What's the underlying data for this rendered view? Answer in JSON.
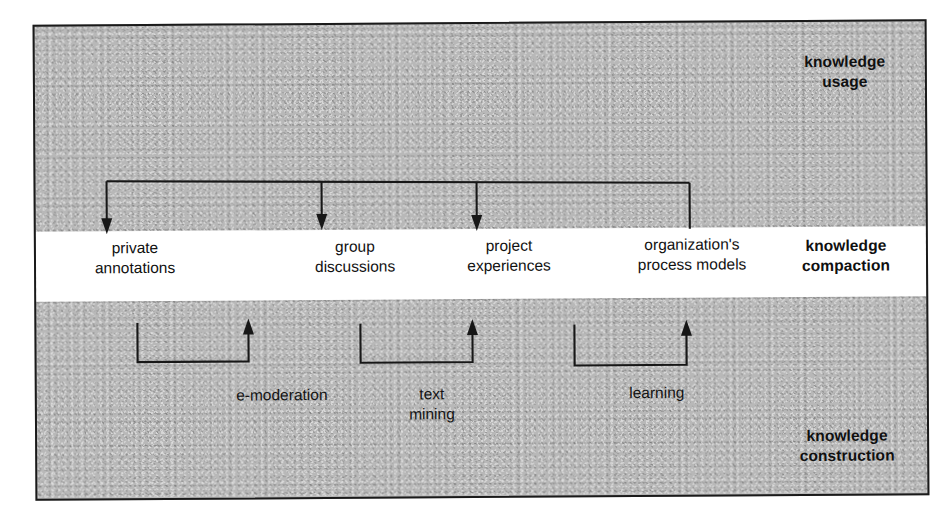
{
  "diagram": {
    "background_color": "#b9b9b9",
    "band_color": "#ffffff",
    "line_color": "#171717",
    "zones": [
      {
        "id": "usage",
        "label": "knowledge\nusage",
        "position": "top-right"
      },
      {
        "id": "compaction",
        "label": "knowledge\ncompaction",
        "position": "middle-right"
      },
      {
        "id": "construction",
        "label": "knowledge\nconstruction",
        "position": "bottom-right"
      }
    ],
    "nodes": [
      {
        "id": "private-annotations",
        "label": "private\nannotations"
      },
      {
        "id": "group-discussions",
        "label": "group\ndiscussions"
      },
      {
        "id": "project-experiences",
        "label": "project\nexperiences"
      },
      {
        "id": "organizations-process-models",
        "label": "organization's\nprocess models"
      }
    ],
    "processes": [
      {
        "id": "e-moderation",
        "label": "e-moderation"
      },
      {
        "id": "text-mining",
        "label": "text\nmining"
      },
      {
        "id": "learning",
        "label": "learning"
      }
    ],
    "connectors": {
      "usage_bus": {
        "description": "horizontal bus in the upper zone feeding arrows down into the compaction band",
        "arrow_targets": [
          "private-annotations",
          "group-discussions",
          "project-experiences"
        ],
        "plain_drop": "organizations-process-models"
      },
      "construction_links": [
        {
          "from": "private-annotations",
          "via": "e-moderation",
          "direction": "up"
        },
        {
          "from": "group-discussions",
          "via": "text-mining",
          "direction": "up"
        },
        {
          "from": "project-experiences",
          "via": "learning",
          "direction": "up"
        }
      ]
    }
  }
}
